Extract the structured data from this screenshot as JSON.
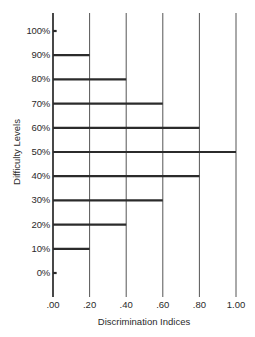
{
  "chart_data": {
    "type": "bar",
    "orientation": "horizontal",
    "title": "",
    "xlabel": "Discrimination Indices",
    "ylabel": "Difficulty Levels",
    "xlim": [
      0,
      1.0
    ],
    "x_ticks": [
      ".00",
      ".20",
      ".40",
      ".60",
      ".80",
      "1.00"
    ],
    "categories": [
      "100%",
      "90%",
      "80%",
      "70%",
      "60%",
      "50%",
      "40%",
      "30%",
      "20%",
      "10%",
      "0%"
    ],
    "values": [
      0.02,
      0.2,
      0.4,
      0.6,
      0.8,
      1.0,
      0.8,
      0.6,
      0.4,
      0.2,
      0.02
    ],
    "grid": {
      "vertical": true,
      "horizontal": false
    },
    "legend": null
  },
  "colors": {
    "bar": "#2b2b2b",
    "grid": "#555555",
    "axis": "#1a1a1a",
    "text": "#2a2a2a"
  }
}
